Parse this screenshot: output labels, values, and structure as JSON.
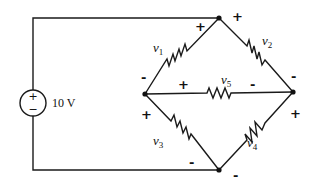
{
  "diagram": {
    "type": "circuit",
    "source": {
      "label": "10 V",
      "plus": "+",
      "minus": "−"
    },
    "resistors": [
      {
        "id": "v1",
        "base": "v",
        "sub": "1",
        "pos": "+",
        "neg": "-"
      },
      {
        "id": "v2",
        "base": "v",
        "sub": "2",
        "pos": "+",
        "neg": "-"
      },
      {
        "id": "v3",
        "base": "v",
        "sub": "3",
        "pos": "+",
        "neg": "-"
      },
      {
        "id": "v4",
        "base": "v",
        "sub": "4",
        "pos": "+",
        "neg": "-"
      },
      {
        "id": "v5",
        "base": "v",
        "sub": "5",
        "pos": "+",
        "neg": "-"
      }
    ],
    "colors": {
      "ink": "#1a1a1a",
      "background": "#ffffff"
    }
  }
}
